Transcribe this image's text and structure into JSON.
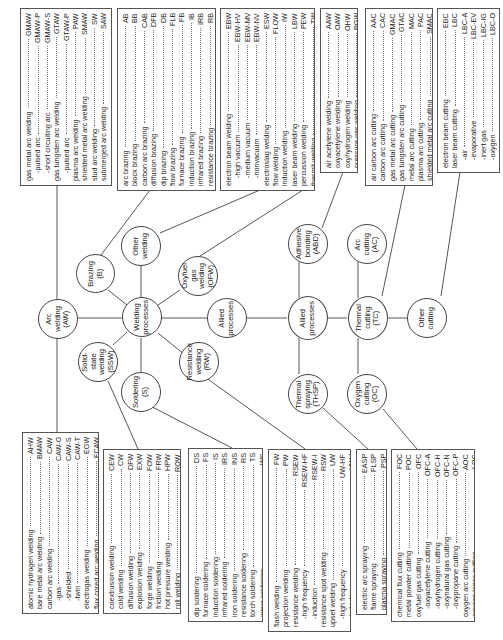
{
  "diagram": {
    "center": "Welding\nprocesses",
    "nodes": {
      "arc_welding": "Arc\nwelding\n(AW)",
      "brazing": "Brazing\n(B)",
      "other_welding": "Other\nwelding",
      "oxyfuel_gas_welding": "Oxyfuel\ngas\nwelding\n(OFW)",
      "allied_processes_link": "Allied\nprocesses",
      "solid_state_welding": "Solid-\nstate\nwelding\n(SSW)",
      "soldering": "Soldering\n(S)",
      "resistance_welding": "Resistance\nwelding\n(RW)",
      "allied_processes": "Allied\nprocesses",
      "adhesive_bonding": "Adhesive\nbonding\n(ABD)",
      "thermal_spraying": "Thermal\nspraying\n(THSP)",
      "thermal_cutting": "Thermal\ncutting\n(TC)",
      "arc_cutting": "Arc\ncutting\n(AC)",
      "oxygen_cutting": "Oxygen\ncutting\n(OC)",
      "other_cutting": "Other\ncutting"
    },
    "boxes": {
      "arc_welding_top": [
        {
          "label": "gas metal arc welding",
          "code": "GMAW"
        },
        {
          "label": "-pulsed arc",
          "code": "GMAW-P",
          "sub": true
        },
        {
          "label": "-short circuiting arc",
          "code": "GMAW-S",
          "sub": true
        },
        {
          "label": "gas tungsten arc welding",
          "code": "GTAW"
        },
        {
          "label": "-pulsed arc",
          "code": "GTAW-P",
          "sub": true
        },
        {
          "label": "plasma arc welding",
          "code": "PAW"
        },
        {
          "label": "shielded metal arc welding",
          "code": "SMAW"
        },
        {
          "label": "stud arc welding",
          "code": "SW"
        },
        {
          "label": "submerged arc welding",
          "code": "SAW"
        },
        {
          "label": "-series",
          "code": "SAW-S",
          "sub": true
        }
      ],
      "brazing": [
        {
          "label": "arc brazing",
          "code": "AB"
        },
        {
          "label": "block brazing",
          "code": "BB"
        },
        {
          "label": "carbon arc brazing",
          "code": "CAB"
        },
        {
          "label": "diffusion brazing",
          "code": "DFB"
        },
        {
          "label": "dip brazing",
          "code": "DB"
        },
        {
          "label": "flow brazing",
          "code": "FLB"
        },
        {
          "label": "furnace brazing",
          "code": "FB"
        },
        {
          "label": "induction brazing",
          "code": "IB"
        },
        {
          "label": "infrared brazing",
          "code": "IRB"
        },
        {
          "label": "resistance brazing",
          "code": "RB"
        },
        {
          "label": "torch brazing",
          "code": "TB"
        }
      ],
      "other_welding": [
        {
          "label": "electron beam welding",
          "code": "EBW"
        },
        {
          "label": "-high vacuum",
          "code": "EBW-HV",
          "sub": true
        },
        {
          "label": "-medium vacuum",
          "code": "EBW-MV",
          "sub": true
        },
        {
          "label": "-nonvacuum",
          "code": "EBW-NV",
          "sub": true
        },
        {
          "label": "electroslag welding",
          "code": "ESW"
        },
        {
          "label": "flow welding",
          "code": "FLOW"
        },
        {
          "label": "induction welding",
          "code": "IW"
        },
        {
          "label": "laser beam welding",
          "code": "LBW"
        },
        {
          "label": "percussion welding",
          "code": "PEW"
        },
        {
          "label": "thermit welding",
          "code": "TW"
        }
      ],
      "oxyfuel_gas_welding": [
        {
          "label": "air acetylene welding",
          "code": "AAW"
        },
        {
          "label": "oxyacetylene welding",
          "code": "OAW"
        },
        {
          "label": "oxyhydrogen welding",
          "code": "OHW"
        },
        {
          "label": "pressure gas welding",
          "code": "PGW"
        }
      ],
      "arc_cutting": [
        {
          "label": "air carbon arc cutting",
          "code": "AAC"
        },
        {
          "label": "carbon arc cutting",
          "code": "CAC"
        },
        {
          "label": "gas metal arc cutting",
          "code": "GMAC"
        },
        {
          "label": "gas tungsten arc cutting",
          "code": "GTAC"
        },
        {
          "label": "metal arc cutting",
          "code": "MAC"
        },
        {
          "label": "plasma arc cutting",
          "code": "PAC"
        },
        {
          "label": "shielded metal arc cutting",
          "code": "SMAC"
        }
      ],
      "other_cutting": [
        {
          "label": "electron beam cutting",
          "code": "EBC"
        },
        {
          "label": "laser beam cutting",
          "code": "LBC"
        },
        {
          "label": "-air",
          "code": "LBC-A",
          "sub": true
        },
        {
          "label": "-evaporative",
          "code": "LBC-EV",
          "sub": true
        },
        {
          "label": "-inert gas",
          "code": "LBC-IG",
          "sub": true
        },
        {
          "label": "-oxygen",
          "code": "LBC-O",
          "sub": true
        }
      ],
      "arc_welding_bottom": [
        {
          "label": "atomic hydrogen welding",
          "code": "AHW"
        },
        {
          "label": "bare metal arc welding",
          "code": "BMAW"
        },
        {
          "label": "carbon arc welding",
          "code": "CAW"
        },
        {
          "label": "-gas",
          "code": "CAW-G",
          "sub": true
        },
        {
          "label": "-shielded",
          "code": "CAW-S",
          "sub": true
        },
        {
          "label": "-twin",
          "code": "CAW-T",
          "sub": true
        },
        {
          "label": "electrogas welding",
          "code": "EGW"
        },
        {
          "label": "flux cored arc welding",
          "code": "FCAW"
        }
      ],
      "solid_state_welding": [
        {
          "label": "coextrusion welding",
          "code": "CEW"
        },
        {
          "label": "cold welding",
          "code": "CW"
        },
        {
          "label": "diffusion welding",
          "code": "DFW"
        },
        {
          "label": "explosion welding",
          "code": "EXW"
        },
        {
          "label": "forge welding",
          "code": "FOW"
        },
        {
          "label": "friction welding",
          "code": "FRW"
        },
        {
          "label": "hot pressure welding",
          "code": "HPW"
        },
        {
          "label": "roll welding",
          "code": "ROW"
        },
        {
          "label": "ultrasonic welding",
          "code": "USW"
        }
      ],
      "soldering": [
        {
          "label": "dip soldering",
          "code": "DS"
        },
        {
          "label": "furnace soldering",
          "code": "FS"
        },
        {
          "label": "induction soldering",
          "code": "IS"
        },
        {
          "label": "infrared soldering",
          "code": "IRS"
        },
        {
          "label": "iron soldering",
          "code": "INS"
        },
        {
          "label": "resistance soldering",
          "code": "RS"
        },
        {
          "label": "torch soldering",
          "code": "TS"
        },
        {
          "label": "wave soldering",
          "code": "WS"
        }
      ],
      "resistance_welding": [
        {
          "label": "flash welding",
          "code": "FW"
        },
        {
          "label": "projection welding",
          "code": "PW"
        },
        {
          "label": "resistance welding",
          "code": "RSEW"
        },
        {
          "label": "-high frequency",
          "code": "RSEW-HF",
          "sub": true
        },
        {
          "label": "-induction",
          "code": "RSEW-I",
          "sub": true
        },
        {
          "label": "resistance spot welding",
          "code": "RSW"
        },
        {
          "label": "upset welding",
          "code": "UW"
        },
        {
          "label": "-high frequency",
          "code": "UW-HF",
          "sub": true
        },
        {
          "label": "-induction",
          "code": "UW-I",
          "sub": true
        }
      ],
      "thermal_spraying": [
        {
          "label": "electric arc spraying",
          "code": "EASP"
        },
        {
          "label": "flame spraying",
          "code": "FLSP"
        },
        {
          "label": "plasma spraying",
          "code": "PSP"
        }
      ],
      "oxygen_cutting": [
        {
          "label": "chemical flux cutting",
          "code": "FOC"
        },
        {
          "label": "metal powder cutting",
          "code": "POC"
        },
        {
          "label": "oxyfuel gas cutting",
          "code": "OFC"
        },
        {
          "label": "-oxyacetylene cutting",
          "code": "OFC-A",
          "sub": true
        },
        {
          "label": "-oxyhydrogen cutting",
          "code": "OFC-H",
          "sub": true
        },
        {
          "label": "-oxynatural gas cutting",
          "code": "OFC-N",
          "sub": true
        },
        {
          "label": "-oxypropane cutting",
          "code": "OFC-P",
          "sub": true
        },
        {
          "label": "oxygen arc cutting",
          "code": "AOC"
        },
        {
          "label": "oxygen lance cutting",
          "code": "LOC"
        }
      ]
    }
  }
}
